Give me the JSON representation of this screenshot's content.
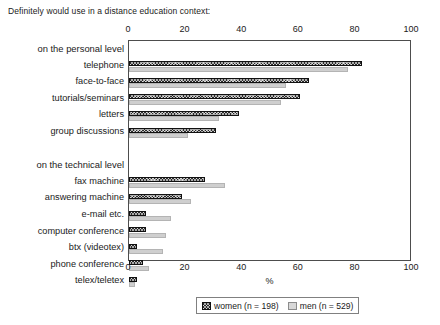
{
  "chart_data": {
    "type": "bar",
    "orientation": "horizontal",
    "title": "Definitely would use in a distance education context:",
    "xlabel": "%",
    "ylabel": "",
    "xlim": [
      0,
      100
    ],
    "xticks": [
      0,
      20,
      40,
      60,
      80,
      100
    ],
    "xtick_labels": [
      "0",
      "20",
      "40",
      "60",
      "80",
      "100"
    ],
    "grid": false,
    "axis_ticks_position": "top-and-bottom",
    "legend_position": "bottom-center",
    "groups": [
      {
        "heading": "on the personal level",
        "categories": [
          "telephone",
          "face-to-face",
          "tutorials/seminars",
          "letters",
          "group discussions"
        ]
      },
      {
        "heading": "on the technical level",
        "categories": [
          "fax machine",
          "answering machine",
          "e-mail etc.",
          "computer conference",
          "btx (videotex)",
          "phone conference",
          "telex/teletex"
        ]
      }
    ],
    "categories": [
      "telephone",
      "face-to-face",
      "tutorials/seminars",
      "letters",
      "group discussions",
      "fax machine",
      "answering machine",
      "e-mail etc.",
      "computer conference",
      "btx (videotex)",
      "phone conference",
      "telex/teletex"
    ],
    "series": [
      {
        "name": "women (n = 198)",
        "color": "#2b2b2b",
        "pattern": "cross-hatch",
        "values": [
          83,
          64,
          61,
          39,
          31,
          27,
          19,
          6,
          6,
          3,
          5,
          3
        ]
      },
      {
        "name": "men (n = 529)",
        "color": "#cfcfcf",
        "pattern": "solid-light",
        "values": [
          78,
          56,
          54,
          32,
          21,
          34,
          22,
          15,
          13,
          12,
          7,
          2
        ]
      }
    ]
  },
  "legend": {
    "items": [
      {
        "label": "women (n = 198)"
      },
      {
        "label": "men (n = 529)"
      }
    ]
  }
}
